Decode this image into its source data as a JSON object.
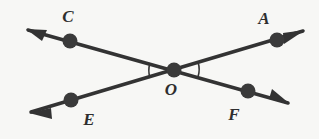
{
  "figure": {
    "type": "geometry-diagram",
    "background_color": "#f7f7f5",
    "stroke_color": "#333333",
    "label_color": "#2e2e2e",
    "width": 319,
    "height": 139,
    "points": [
      {
        "id": "C",
        "label": "C",
        "x": 70,
        "y": 41,
        "label_x": 68,
        "label_y": 22,
        "marked": true
      },
      {
        "id": "A",
        "label": "A",
        "x": 277,
        "y": 40,
        "label_x": 264,
        "label_y": 24,
        "marked": true
      },
      {
        "id": "O",
        "label": "O",
        "x": 174,
        "y": 70,
        "label_x": 171,
        "label_y": 95,
        "marked": true
      },
      {
        "id": "E",
        "label": "E",
        "x": 71,
        "y": 100,
        "label_x": 89,
        "label_y": 125,
        "marked": true
      },
      {
        "id": "F",
        "label": "F",
        "x": 248,
        "y": 91,
        "label_x": 234,
        "label_y": 120,
        "marked": true
      }
    ],
    "lines": [
      {
        "id": "line-CF",
        "through": [
          "C",
          "O",
          "F"
        ],
        "from": {
          "x": 28,
          "y": 30
        },
        "to": {
          "x": 288,
          "y": 103
        },
        "arrow_start": true,
        "arrow_end": true
      },
      {
        "id": "line-EA",
        "through": [
          "E",
          "O",
          "A"
        ],
        "from": {
          "x": 31,
          "y": 112
        },
        "to": {
          "x": 303,
          "y": 31
        },
        "arrow_start": true,
        "arrow_end": true
      }
    ],
    "angle_arcs": [
      {
        "id": "arc-COE",
        "vertex": "O",
        "between": [
          "C",
          "E"
        ],
        "side": "left",
        "radius": 25
      },
      {
        "id": "arc-AOF",
        "vertex": "O",
        "between": [
          "A",
          "F"
        ],
        "side": "right",
        "radius": 25
      }
    ]
  }
}
